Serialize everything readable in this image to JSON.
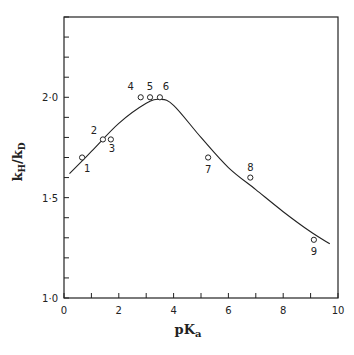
{
  "chart_data": {
    "type": "scatter",
    "title": "",
    "xlabel": "pKa",
    "ylabel": "kH/kD",
    "xlim": [
      0,
      10
    ],
    "ylim": [
      1.0,
      2.4
    ],
    "x_ticks": [
      0,
      2,
      4,
      6,
      8,
      10
    ],
    "x_tick_labels": [
      "0",
      "2",
      "4",
      "6",
      "8",
      "10"
    ],
    "y_ticks": [
      1.0,
      1.5,
      2.0
    ],
    "y_tick_labels": [
      "1·0",
      "1·5",
      "2·0"
    ],
    "grid": false,
    "legend": null,
    "series": [
      {
        "name": "data points",
        "marker": "open-circle",
        "points": [
          {
            "label": "1",
            "x": 0.66,
            "y": 1.7
          },
          {
            "label": "2",
            "x": 1.42,
            "y": 1.79
          },
          {
            "label": "3",
            "x": 1.71,
            "y": 1.79
          },
          {
            "label": "4",
            "x": 2.8,
            "y": 2.0
          },
          {
            "label": "5",
            "x": 3.14,
            "y": 2.0
          },
          {
            "label": "6",
            "x": 3.5,
            "y": 2.0
          },
          {
            "label": "7",
            "x": 5.26,
            "y": 1.7
          },
          {
            "label": "8",
            "x": 6.8,
            "y": 1.6
          },
          {
            "label": "9",
            "x": 9.12,
            "y": 1.29
          }
        ]
      },
      {
        "name": "fitted curve",
        "marker": "line",
        "x": [
          0.2,
          1.0,
          2.0,
          3.0,
          3.5,
          4.0,
          5.0,
          6.0,
          7.0,
          8.0,
          9.0,
          9.7
        ],
        "y": [
          1.62,
          1.73,
          1.87,
          1.97,
          1.99,
          1.96,
          1.8,
          1.65,
          1.54,
          1.43,
          1.33,
          1.27
        ]
      }
    ]
  }
}
